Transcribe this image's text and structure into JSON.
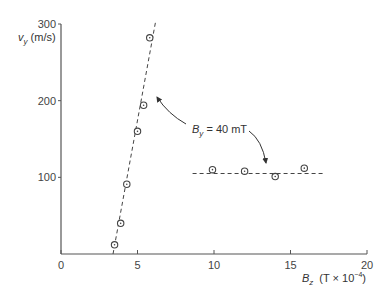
{
  "chart_data": {
    "type": "scatter",
    "title": "",
    "xlabel": "B_z (T×10^-4)",
    "ylabel": "v_y (m/s)",
    "xlim": [
      0,
      20
    ],
    "ylim": [
      0,
      300
    ],
    "x_ticks": [
      0,
      5,
      10,
      15,
      20
    ],
    "y_ticks": [
      0,
      100,
      200,
      300
    ],
    "x_tick_labels": [
      "0",
      "5",
      "10",
      "15",
      "20"
    ],
    "y_tick_labels": [
      "",
      "100",
      "200",
      "300"
    ],
    "grid": false,
    "legend": null,
    "series": [
      {
        "name": "steep",
        "marker": "circle-dot",
        "fit_line": "dashed",
        "fit_line_range": {
          "x": [
            3.4,
            6.2
          ],
          "y": [
            0,
            305
          ]
        },
        "x": [
          3.5,
          3.9,
          4.3,
          5.0,
          5.4,
          5.8
        ],
        "y": [
          12,
          40,
          91,
          160,
          194,
          282
        ]
      },
      {
        "name": "flat",
        "marker": "circle-dot",
        "fit_line": "dashed",
        "fit_line_range": {
          "x": [
            8.6,
            17.2
          ],
          "y": [
            105,
            105
          ]
        },
        "x": [
          9.9,
          12.0,
          14.0,
          15.9
        ],
        "y": [
          110,
          108,
          101,
          112
        ]
      }
    ],
    "annotations": [
      {
        "text": "B_y = 40 mT",
        "position": {
          "x": 9.6,
          "y": 157
        },
        "arrows_to": [
          {
            "x": 6.1,
            "y": 200
          },
          {
            "x": 13.4,
            "y": 118
          }
        ]
      }
    ]
  },
  "labels": {
    "y_axis_var": "v",
    "y_axis_sub": "y",
    "y_axis_unit": " (m/s)",
    "x_axis_var": "B",
    "x_axis_sub": "z",
    "x_axis_unit_pre": "(T × 10",
    "x_axis_unit_exp": "−4",
    "x_axis_unit_post": ")",
    "annotation_var": "B",
    "annotation_sub": "y",
    "annotation_rest": " = 40 mT"
  },
  "colors": {
    "axis": "#555555",
    "marker": "#444444",
    "fit_line": "#444444",
    "text": "#333333",
    "background": "#ffffff"
  }
}
